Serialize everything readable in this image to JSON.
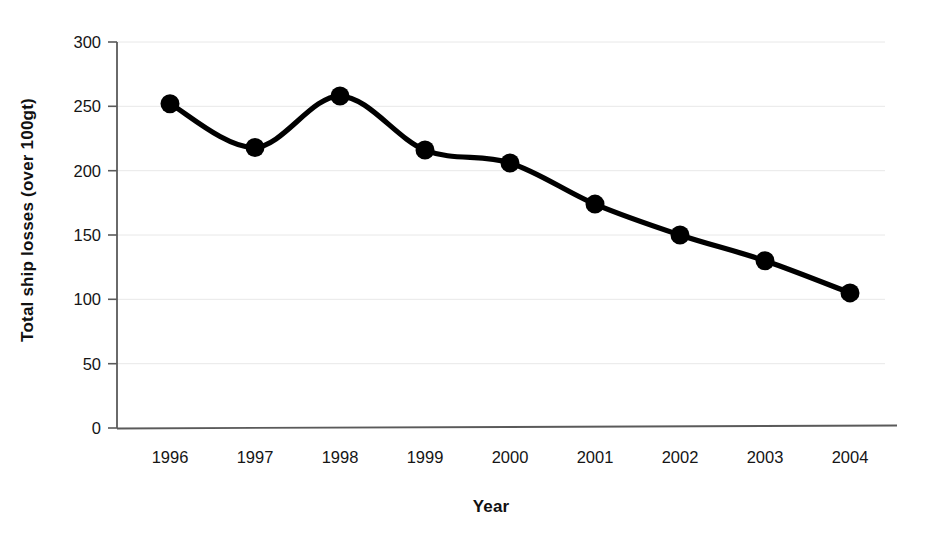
{
  "chart_data": {
    "type": "line",
    "title": "",
    "xlabel": "Year",
    "ylabel": "Total ship losses (over 100gt)",
    "categories": [
      "1996",
      "1997",
      "1998",
      "1999",
      "2000",
      "2001",
      "2002",
      "2003",
      "2004"
    ],
    "values": [
      252,
      218,
      258,
      216,
      206,
      174,
      150,
      130,
      105
    ],
    "series": [
      {
        "name": "Total ship losses (over 100gt)",
        "values": [
          252,
          218,
          258,
          216,
          206,
          174,
          150,
          130,
          105
        ]
      }
    ],
    "ylim": [
      0,
      300
    ],
    "yticks": [
      0,
      50,
      100,
      150,
      200,
      250,
      300
    ],
    "ytick_labels": [
      "0",
      "50",
      "100",
      "150",
      "200",
      "250",
      "300"
    ],
    "grid": true,
    "grid_axis": "y",
    "legend": false,
    "legend_position": "none",
    "marker": "filled-circle",
    "line_style": "smooth-spline",
    "line_color": "#000000",
    "marker_color": "#000000",
    "grid_color": "#e8e8e8",
    "axis_color": "#5a5a5a",
    "background_color": "#ffffff"
  },
  "axes": {
    "y_title": "Total ship losses (over 100gt)",
    "x_title": "Year"
  }
}
